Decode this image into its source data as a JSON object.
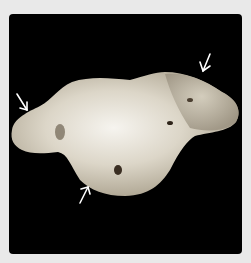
{
  "figure": {
    "background_color": "#e9e9e9",
    "panel_color": "#000000",
    "annotations": [
      {
        "type": "arrow",
        "direction": "down-left",
        "position": "top-right"
      },
      {
        "type": "arrow",
        "direction": "down-right",
        "position": "left"
      },
      {
        "type": "arrow",
        "direction": "up-right",
        "position": "bottom-center"
      }
    ]
  }
}
